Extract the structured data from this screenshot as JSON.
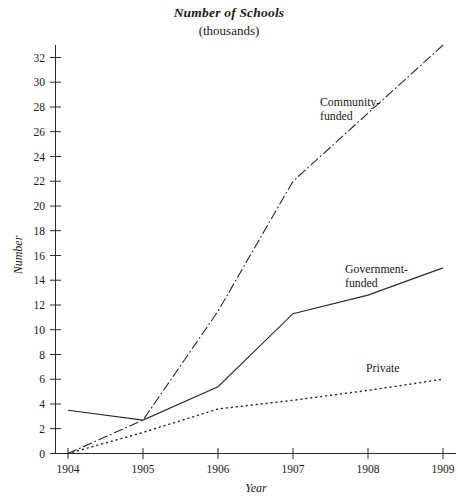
{
  "chart_data": {
    "type": "line",
    "title": "Number of Schools",
    "subtitle": "(thousands)",
    "xlabel": "Year",
    "ylabel": "Number",
    "categories": [
      "1904",
      "1905",
      "1906",
      "1907",
      "1908",
      "1909"
    ],
    "x": [
      1904,
      1905,
      1906,
      1907,
      1908,
      1909
    ],
    "xlim": [
      1904,
      1909
    ],
    "ylim": [
      0,
      33
    ],
    "y_ticks": [
      0,
      2,
      4,
      6,
      8,
      10,
      12,
      14,
      16,
      18,
      20,
      22,
      24,
      26,
      28,
      30,
      32
    ],
    "grid": false,
    "legend_position": "inline-annotations",
    "series": [
      {
        "name": "Community-funded",
        "label_line1": "Community-",
        "label_line2": "funded",
        "style": "dash-dot",
        "values": [
          0.0,
          2.7,
          11.5,
          22.0,
          27.5,
          33.0
        ]
      },
      {
        "name": "Government-funded",
        "label_line1": "Government-",
        "label_line2": "funded",
        "style": "solid",
        "values": [
          3.5,
          2.7,
          5.4,
          11.3,
          12.8,
          15.0
        ]
      },
      {
        "name": "Private",
        "label_line1": "Private",
        "label_line2": "",
        "style": "dotted",
        "values": [
          0.0,
          1.7,
          3.6,
          4.3,
          5.1,
          6.0
        ]
      }
    ]
  },
  "axis": {
    "y_tick_labels": [
      "0",
      "2",
      "4",
      "6",
      "8",
      "10",
      "12",
      "14",
      "16",
      "18",
      "20",
      "22",
      "24",
      "26",
      "28",
      "30",
      "32"
    ],
    "x_tick_labels": [
      "1904",
      "1905",
      "1906",
      "1907",
      "1908",
      "1909"
    ]
  }
}
